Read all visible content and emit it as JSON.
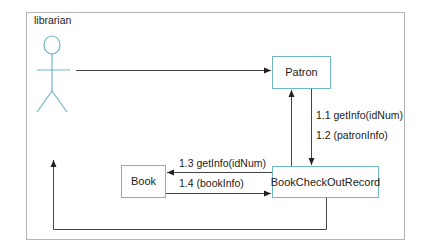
{
  "diagram": {
    "type": "UML collaboration diagram",
    "actor": {
      "name": "librarian"
    },
    "objects": {
      "patron": "Patron",
      "book": "Book",
      "record": "BookCheckOutRecord"
    },
    "messages": {
      "m1_1": "1.1 getInfo(idNum)",
      "m1_2": "1.2 (patronInfo)",
      "m1_3": "1.3 getInfo(idNum)",
      "m1_4": "1.4 (bookInfo)"
    },
    "colors": {
      "box_border": "#6fb8c4",
      "actor": "#6fb8c4",
      "line": "#444444",
      "frame": "#b5b5b5"
    }
  }
}
